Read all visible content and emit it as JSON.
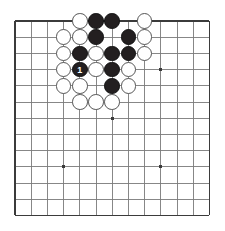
{
  "diagram": {
    "type": "go-board-diagram",
    "board_size": 13,
    "watermark_text": "",
    "geometry": {
      "origin_x": 15,
      "origin_y": 21,
      "spacing": 16.2,
      "stone_radius": 7.8,
      "border_color": "#3b3b3b",
      "line_color": "#7a7a7a",
      "background_color": "#ffffff",
      "black_color": "#231f20",
      "white_color": "#ffffff",
      "white_edge_color": "#555555",
      "star_color": "#3b3b3b",
      "star_size": 3
    },
    "star_points": [
      {
        "col": 3,
        "row": 3
      },
      {
        "col": 9,
        "row": 3
      },
      {
        "col": 6,
        "row": 6
      },
      {
        "col": 3,
        "row": 9
      },
      {
        "col": 9,
        "row": 9
      }
    ],
    "stones": [
      {
        "col": 4,
        "row": 0,
        "color": "white",
        "label": ""
      },
      {
        "col": 5,
        "row": 0,
        "color": "black",
        "label": ""
      },
      {
        "col": 6,
        "row": 0,
        "color": "black",
        "label": ""
      },
      {
        "col": 8,
        "row": 0,
        "color": "white",
        "label": ""
      },
      {
        "col": 3,
        "row": 1,
        "color": "white",
        "label": ""
      },
      {
        "col": 4,
        "row": 1,
        "color": "white",
        "label": ""
      },
      {
        "col": 5,
        "row": 1,
        "color": "black",
        "label": ""
      },
      {
        "col": 7,
        "row": 1,
        "color": "black",
        "label": ""
      },
      {
        "col": 8,
        "row": 1,
        "color": "white",
        "label": ""
      },
      {
        "col": 3,
        "row": 2,
        "color": "white",
        "label": ""
      },
      {
        "col": 4,
        "row": 2,
        "color": "black",
        "label": ""
      },
      {
        "col": 5,
        "row": 2,
        "color": "white",
        "label": ""
      },
      {
        "col": 6,
        "row": 2,
        "color": "black",
        "label": ""
      },
      {
        "col": 7,
        "row": 2,
        "color": "black",
        "label": ""
      },
      {
        "col": 8,
        "row": 2,
        "color": "white",
        "label": ""
      },
      {
        "col": 3,
        "row": 3,
        "color": "white",
        "label": ""
      },
      {
        "col": 4,
        "row": 3,
        "color": "black",
        "label": "1"
      },
      {
        "col": 5,
        "row": 3,
        "color": "white",
        "label": ""
      },
      {
        "col": 6,
        "row": 3,
        "color": "black",
        "label": ""
      },
      {
        "col": 7,
        "row": 3,
        "color": "white",
        "label": ""
      },
      {
        "col": 3,
        "row": 4,
        "color": "white",
        "label": ""
      },
      {
        "col": 4,
        "row": 4,
        "color": "white",
        "label": ""
      },
      {
        "col": 6,
        "row": 4,
        "color": "black",
        "label": ""
      },
      {
        "col": 7,
        "row": 4,
        "color": "white",
        "label": ""
      },
      {
        "col": 4,
        "row": 5,
        "color": "white",
        "label": ""
      },
      {
        "col": 5,
        "row": 5,
        "color": "white",
        "label": ""
      },
      {
        "col": 6,
        "row": 5,
        "color": "white",
        "label": ""
      }
    ],
    "move_markers": [
      {
        "label": "1",
        "col": 4,
        "row": 3,
        "color": "black"
      }
    ]
  }
}
